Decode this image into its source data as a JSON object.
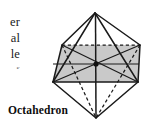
{
  "page": {
    "background_color": "#ffffff",
    "width": 151,
    "height": 129
  },
  "body_text": {
    "description": "right-edge fragments of clipped paragraph text",
    "fragments": [
      {
        "text": "er"
      },
      {
        "text": "al"
      },
      {
        "text": "le"
      },
      {
        "text": "s"
      }
    ]
  },
  "caption": {
    "label": "Octahedron"
  },
  "figure": {
    "name": "octahedron-diagram",
    "shape": "octahedron",
    "stroke_color": "#1a1a1a",
    "fill_color": "#c9c9c9",
    "center_dot_color": "#111111",
    "hidden_edge_style": "dashed",
    "vertices": {
      "top": {
        "x": 54,
        "y": 9
      },
      "bottom": {
        "x": 55,
        "y": 114
      },
      "front_left": {
        "x": 12,
        "y": 78
      },
      "front_right": {
        "x": 97,
        "y": 78
      },
      "back_left": {
        "x": 21,
        "y": 41
      },
      "back_right": {
        "x": 99,
        "y": 41
      }
    },
    "equatorial_square": {
      "label": "shaded cross-section",
      "corners": [
        {
          "x": 12,
          "y": 78
        },
        {
          "x": 21,
          "y": 41
        },
        {
          "x": 99,
          "y": 41
        },
        {
          "x": 97,
          "y": 78
        }
      ]
    },
    "center_point": {
      "x": 55,
      "y": 60
    }
  }
}
